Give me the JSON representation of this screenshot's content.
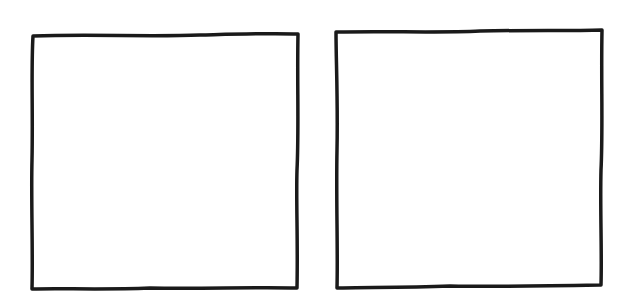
{
  "diagram": {
    "background": "#ffffff",
    "stroke_color": "#1a1a1a",
    "stroke_width": 3.5,
    "style": "hand-drawn",
    "shapes": [
      {
        "id": "left-square",
        "type": "square",
        "label": "",
        "x": 32,
        "y": 33,
        "width": 267,
        "height": 256
      },
      {
        "id": "right-square",
        "type": "square",
        "label": "",
        "x": 335,
        "y": 30,
        "width": 268,
        "height": 258
      }
    ]
  }
}
